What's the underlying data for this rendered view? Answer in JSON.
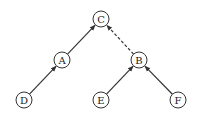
{
  "diagram": {
    "type": "tree",
    "nodes": [
      {
        "id": "C",
        "label": "C",
        "x": 101,
        "y": 19
      },
      {
        "id": "A",
        "label": "A",
        "x": 62,
        "y": 60
      },
      {
        "id": "B",
        "label": "B",
        "x": 139,
        "y": 60
      },
      {
        "id": "D",
        "label": "D",
        "x": 24,
        "y": 100
      },
      {
        "id": "E",
        "label": "E",
        "x": 101,
        "y": 100
      },
      {
        "id": "F",
        "label": "F",
        "x": 178,
        "y": 100
      }
    ],
    "edges": [
      {
        "from": "D",
        "to": "A",
        "style": "solid"
      },
      {
        "from": "A",
        "to": "C",
        "style": "solid"
      },
      {
        "from": "E",
        "to": "B",
        "style": "solid"
      },
      {
        "from": "F",
        "to": "B",
        "style": "solid"
      },
      {
        "from": "B",
        "to": "C",
        "style": "dashed"
      }
    ],
    "node_radius": 8,
    "colors": {
      "stroke": "#333333",
      "fill": "#ffffff",
      "text": "#222222"
    }
  }
}
